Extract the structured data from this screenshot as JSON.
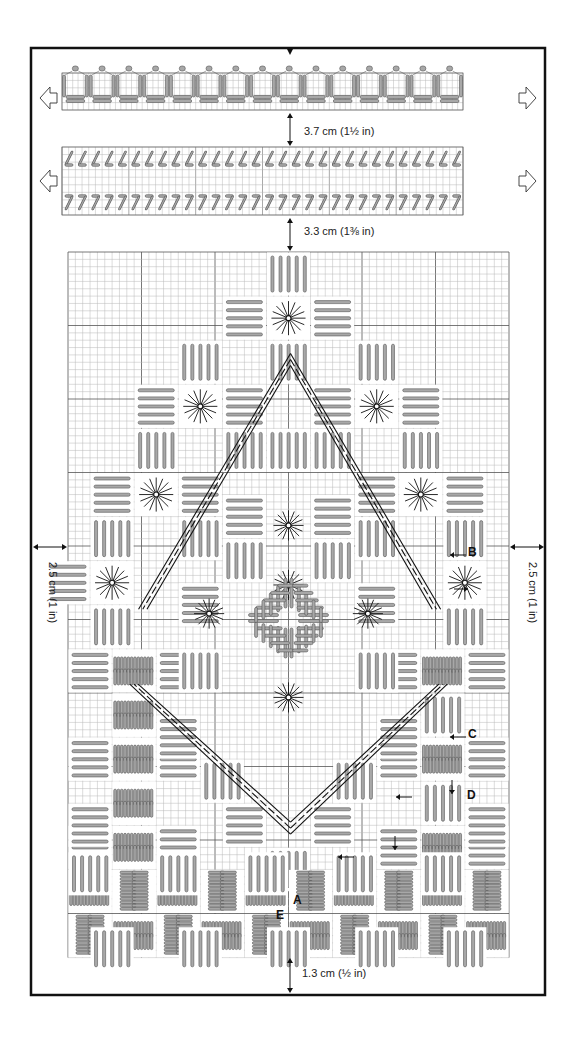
{
  "diagram": {
    "type": "needlework-chart",
    "frame": {
      "x": 31,
      "y": 48,
      "w": 514,
      "h": 947,
      "color": "#111111"
    },
    "colors": {
      "grid_minor": "#b8b8b8",
      "grid_major": "#555555",
      "stitch_fill": "#a8a8a8",
      "stitch_stroke": "#555555",
      "ink": "#111111",
      "arrow_fill": "#ffffff"
    }
  },
  "measurements": {
    "top_gap": "3.7 cm (1½ in)",
    "second_gap": "3.3 cm (1⅜ in)",
    "left_margin": "2.5 cm (1 in)",
    "right_margin": "2.5 cm (1 in)",
    "bottom_margin": "1.3 cm (½ in)"
  },
  "strips": [
    {
      "name": "top-border-strip",
      "x": 62,
      "y": 61,
      "w": 401,
      "h": 49,
      "repeats": 15,
      "motif": "arch"
    },
    {
      "name": "zigzag-border-strip",
      "x": 62,
      "y": 147,
      "w": 401,
      "h": 68,
      "repeats": 30,
      "motif": "angle"
    }
  ],
  "main_grid": {
    "x": 68,
    "y": 252,
    "cols": 60,
    "rows": 96,
    "cell": 7.35,
    "major_every": 10
  },
  "labels": {
    "A": "A",
    "B": "B",
    "C": "C",
    "D": "D",
    "E": "E"
  }
}
